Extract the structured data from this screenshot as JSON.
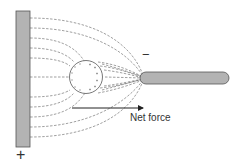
{
  "diagram": {
    "labels": {
      "net_force": "Net force",
      "positive_sign": "+",
      "negative_sign": "−"
    },
    "colors": {
      "plate_fill": "#b3b3b3",
      "plate_stroke": "#555555",
      "rod_fill": "#b3b3b3",
      "rod_stroke": "#555555",
      "field_line": "#666666",
      "sphere_stroke": "#555555",
      "arrow": "#222222"
    },
    "components": [
      {
        "name": "positive-plate",
        "charge": "+"
      },
      {
        "name": "neutral-sphere",
        "induced_charges_left": "-",
        "induced_charges_right": "+"
      },
      {
        "name": "negative-rod",
        "charge": "-"
      }
    ]
  }
}
